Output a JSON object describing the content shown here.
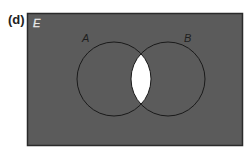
{
  "figure": {
    "part_label": "(d)",
    "universal_set_label": "E",
    "sets": [
      {
        "label": "A",
        "cx": 114,
        "cy": 79,
        "r": 37
      },
      {
        "label": "B",
        "cx": 168,
        "cy": 79,
        "r": 37
      }
    ],
    "shaded_region": "(A ∩ B)'",
    "colors": {
      "shaded": "#5b5b5b",
      "unshaded": "#ffffff",
      "outline": "#1a1a1a",
      "label_text": "#1f1f1f",
      "universal_label": "#e8e8e8"
    }
  }
}
